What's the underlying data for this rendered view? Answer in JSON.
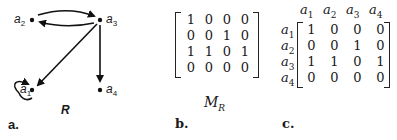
{
  "panels": {
    "a": {
      "label": "a.",
      "graph_label": "R",
      "nodes": [
        {
          "name": "a",
          "sub": "1"
        },
        {
          "name": "a",
          "sub": "2"
        },
        {
          "name": "a",
          "sub": "3"
        },
        {
          "name": "a",
          "sub": "4"
        }
      ],
      "edges": [
        {
          "from": "a2",
          "to": "a3"
        },
        {
          "from": "a3",
          "to": "a2"
        },
        {
          "from": "a3",
          "to": "a1"
        },
        {
          "from": "a3",
          "to": "a4"
        },
        {
          "from": "a1",
          "to": "a1"
        }
      ]
    },
    "b": {
      "label": "b.",
      "matrix_name": "M",
      "matrix_sub": "R",
      "rows": [
        [
          "1",
          "0",
          "0",
          "0"
        ],
        [
          "0",
          "0",
          "1",
          "0"
        ],
        [
          "1",
          "1",
          "0",
          "1"
        ],
        [
          "0",
          "0",
          "0",
          "0"
        ]
      ]
    },
    "c": {
      "label": "c.",
      "col_headers": [
        {
          "name": "a",
          "sub": "1"
        },
        {
          "name": "a",
          "sub": "2"
        },
        {
          "name": "a",
          "sub": "3"
        },
        {
          "name": "a",
          "sub": "4"
        }
      ],
      "row_headers": [
        {
          "name": "a",
          "sub": "1"
        },
        {
          "name": "a",
          "sub": "2"
        },
        {
          "name": "a",
          "sub": "3"
        },
        {
          "name": "a",
          "sub": "4"
        }
      ],
      "rows": [
        [
          "1",
          "0",
          "0",
          "0"
        ],
        [
          "0",
          "0",
          "1",
          "0"
        ],
        [
          "1",
          "1",
          "0",
          "1"
        ],
        [
          "0",
          "0",
          "0",
          "0"
        ]
      ]
    }
  }
}
